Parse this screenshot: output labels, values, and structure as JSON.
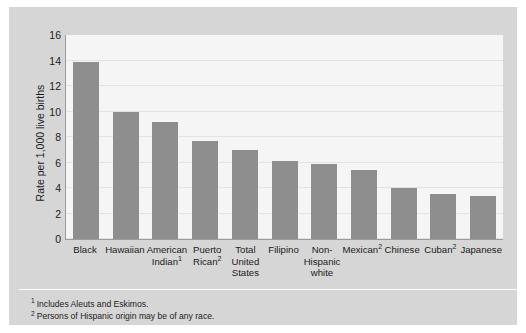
{
  "chart_data": {
    "type": "bar",
    "title": "",
    "subtitle": "",
    "xlabel": "",
    "ylabel": "Rate per 1,000 live births",
    "ylim": [
      0,
      16
    ],
    "y_ticks": [
      0,
      2,
      4,
      6,
      8,
      10,
      12,
      14,
      16
    ],
    "grid": true,
    "legend": false,
    "orientation": "vertical",
    "categories": [
      "Black",
      "Hawaiian",
      "American Indian",
      "Puerto Rican",
      "Total United States",
      "Filipino",
      "Non-Hispanic white",
      "Mexican",
      "Chinese",
      "Cuban",
      "Japanese"
    ],
    "category_labels": [
      {
        "text": "Black",
        "footnote": ""
      },
      {
        "text": "Hawaiian",
        "footnote": ""
      },
      {
        "text": "American Indian",
        "footnote": "1"
      },
      {
        "text": "Puerto Rican",
        "footnote": "2"
      },
      {
        "text": "Total United States",
        "footnote": ""
      },
      {
        "text": "Filipino",
        "footnote": ""
      },
      {
        "text": "Non-Hispanic white",
        "footnote": ""
      },
      {
        "text": "Mexican",
        "footnote": "2"
      },
      {
        "text": "Chinese",
        "footnote": ""
      },
      {
        "text": "Cuban",
        "footnote": "2"
      },
      {
        "text": "Japanese",
        "footnote": ""
      }
    ],
    "values": [
      13.9,
      10.0,
      9.2,
      7.7,
      7.0,
      6.1,
      5.9,
      5.4,
      4.0,
      3.5,
      3.4
    ],
    "bar_color": "#8e8e8e"
  },
  "footnotes": [
    {
      "marker": "1",
      "text": "Includes Aleuts and Eskimos."
    },
    {
      "marker": "2",
      "text": "Persons of Hispanic origin may be of any race."
    }
  ],
  "colors": {
    "page_background": "#ffffff",
    "panel_background": "#d6d6d6",
    "plot_background": "#f5f5f5",
    "gridline": "#e2e2e2",
    "axis_line": "#9b9b9b",
    "bar_fill": "#8e8e8e",
    "text": "#1b1b1b"
  }
}
